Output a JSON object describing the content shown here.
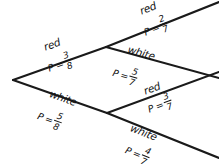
{
  "diagram": {
    "type": "probability-tree",
    "title": "",
    "background_color": "#ffffff",
    "line_color": "#1a1a1a",
    "text_color": "#111111",
    "nodes": [
      {
        "id": "root",
        "x": 13,
        "y": 80
      },
      {
        "id": "red-node",
        "x": 106,
        "y": 47
      },
      {
        "id": "white-node",
        "x": 107,
        "y": 113
      }
    ],
    "branches": [
      {
        "id": "branch-red-1",
        "outcome": "red",
        "p_label": "P =",
        "numerator": "3",
        "denominator": "8",
        "from": "root",
        "to": "red-node",
        "x1": 13,
        "y1": 80,
        "x2": 106,
        "y2": 47,
        "label_x": 44,
        "label_y": 41,
        "label_rot": -19.5,
        "prob_x": 48,
        "prob_y": 58,
        "prob_rot": -19.5
      },
      {
        "id": "branch-white-1",
        "outcome": "white",
        "p_label": "P =",
        "numerator": "5",
        "denominator": "8",
        "from": "root",
        "to": "white-node",
        "x1": 13,
        "y1": 80,
        "x2": 107,
        "y2": 113,
        "label_x": 50,
        "label_y": 87,
        "label_rot": 19.5,
        "prob_x": 38,
        "prob_y": 105,
        "prob_rot": 19.5
      },
      {
        "id": "branch-red-red",
        "outcome": "red",
        "p_label": "P =",
        "numerator": "2",
        "denominator": "7",
        "from": "red-node",
        "to": "end-red-red",
        "x1": 106,
        "y1": 47,
        "x2": 219,
        "y2": 2,
        "label_x": 140,
        "label_y": 5,
        "label_rot": -21.5,
        "prob_x": 144,
        "prob_y": 22,
        "prob_rot": -21.5
      },
      {
        "id": "branch-red-white",
        "outcome": "white",
        "p_label": "P =",
        "numerator": "5",
        "denominator": "7",
        "from": "red-node",
        "to": "end-red-white",
        "x1": 106,
        "y1": 47,
        "x2": 219,
        "y2": 78,
        "label_x": 128,
        "label_y": 43,
        "label_rot": 15.5,
        "prob_x": 113,
        "prob_y": 62,
        "prob_rot": 15.5
      },
      {
        "id": "branch-white-red",
        "outcome": "red",
        "p_label": "P =",
        "numerator": "3",
        "denominator": "7",
        "from": "white-node",
        "to": "end-white-red",
        "x1": 107,
        "y1": 113,
        "x2": 219,
        "y2": 72,
        "label_x": 144,
        "label_y": 85,
        "label_rot": -20.0,
        "prob_x": 148,
        "prob_y": 99,
        "prob_rot": -20.0
      },
      {
        "id": "branch-white-white",
        "outcome": "white",
        "p_label": "P =",
        "numerator": "4",
        "denominator": "7",
        "from": "white-node",
        "to": "end-white-white",
        "x1": 107,
        "y1": 113,
        "x2": 219,
        "y2": 158,
        "label_x": 131,
        "label_y": 121,
        "label_rot": 21.5,
        "prob_x": 126,
        "prob_y": 139,
        "prob_rot": 21.5
      }
    ]
  }
}
